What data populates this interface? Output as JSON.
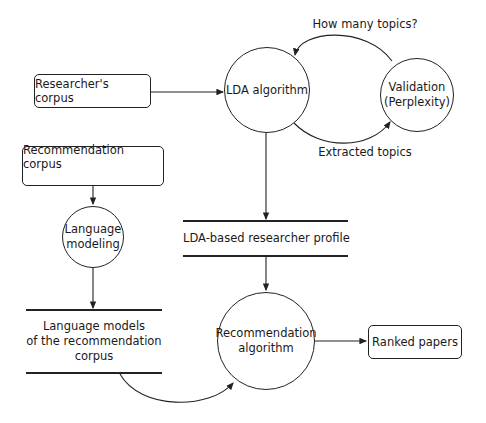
{
  "diagram": {
    "nodes": {
      "researchers_corpus": "Researcher's corpus",
      "lda_algorithm": "LDA algorithm",
      "validation": "Validation\n(Perplexity)",
      "recommendation_corpus": "Recommendation corpus",
      "language_modeling": "Language\nmodeling",
      "lda_profile": "LDA-based researcher profile",
      "language_models": "Language models\nof the recommendation\ncorpus",
      "recommendation_algorithm": "Recommendation\nalgorithm",
      "ranked_papers": "Ranked papers"
    },
    "edge_labels": {
      "how_many_topics": "How many topics?",
      "extracted_topics": "Extracted topics"
    }
  }
}
